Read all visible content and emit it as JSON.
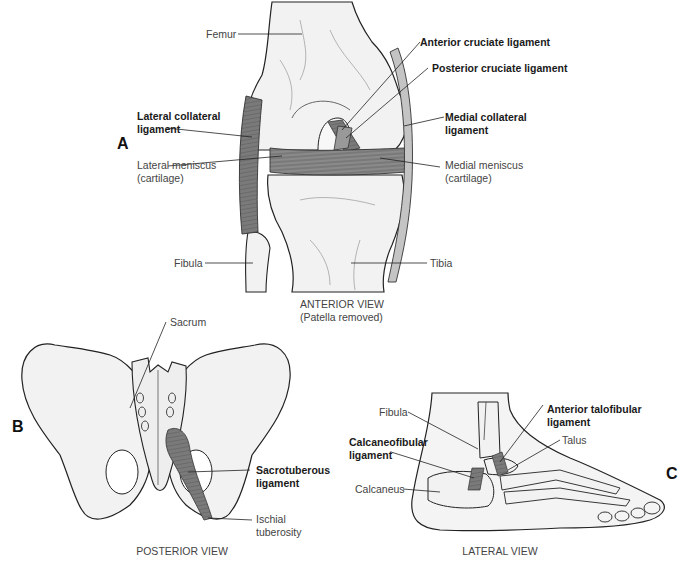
{
  "colors": {
    "bone_fill": "#f2f2f2",
    "outline": "#222222",
    "ligament": "#7a7a7a",
    "ligament_light": "#b4b4b4",
    "leader": "#222222",
    "background": "#ffffff"
  },
  "panels": {
    "A": {
      "letter": "A",
      "caption_line1": "ANTERIOR VIEW",
      "caption_line2": "(Patella removed)",
      "labels": {
        "femur": "Femur",
        "acl": "Anterior cruciate ligament",
        "pcl": "Posterior cruciate ligament",
        "lcl_1": "Lateral collateral",
        "lcl_2": "ligament",
        "mcl_1": "Medial collateral",
        "mcl_2": "ligament",
        "lat_men_1": "Lateral meniscus",
        "lat_men_2": "(cartilage)",
        "med_men_1": "Medial meniscus",
        "med_men_2": "(cartilage)",
        "fibula": "Fibula",
        "tibia": "Tibia"
      }
    },
    "B": {
      "letter": "B",
      "caption": "POSTERIOR VIEW",
      "labels": {
        "sacrum": "Sacrum",
        "sacrotuberous_1": "Sacrotuberous",
        "sacrotuberous_2": "ligament",
        "ischial_1": "Ischial",
        "ischial_2": "tuberosity"
      }
    },
    "C": {
      "letter": "C",
      "caption": "LATERAL VIEW",
      "labels": {
        "fibula": "Fibula",
        "atfl_1": "Anterior talofibular",
        "atfl_2": "ligament",
        "cfl_1": "Calcaneofibular",
        "cfl_2": "ligament",
        "talus": "Talus",
        "calcaneus": "Calcaneus"
      }
    }
  }
}
